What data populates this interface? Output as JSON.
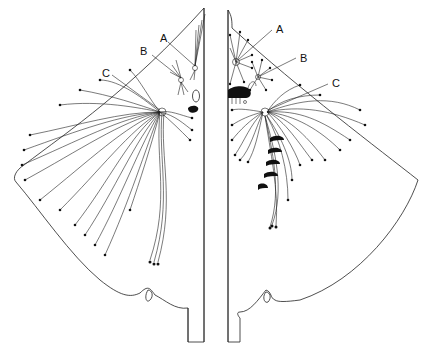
{
  "figure": {
    "type": "anatomical line drawing",
    "panels": [
      {
        "id": "left-panel",
        "labels": [
          {
            "text": "A"
          },
          {
            "text": "B"
          },
          {
            "text": "C"
          }
        ]
      },
      {
        "id": "right-panel",
        "labels": [
          {
            "text": "A"
          },
          {
            "text": "B"
          },
          {
            "text": "C"
          }
        ]
      }
    ],
    "colors": {
      "line": "#111111",
      "background": "#ffffff"
    }
  }
}
